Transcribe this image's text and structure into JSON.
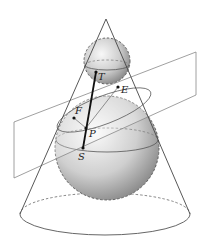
{
  "figure": {
    "labels": {
      "T": "T",
      "E": "E",
      "F": "F",
      "P": "P",
      "S": "S"
    }
  },
  "geometry": {
    "apex": [
      106,
      19
    ],
    "base_ellipse": {
      "cx": 105,
      "cy": 214,
      "rx": 85,
      "ry": 21
    },
    "small_sphere": {
      "cx": 107,
      "cy": 61,
      "r": 23
    },
    "large_sphere": {
      "cx": 107,
      "cy": 148,
      "r": 52
    },
    "points": {
      "T": [
        96,
        72
      ],
      "E": [
        118,
        87
      ],
      "F": [
        74,
        118
      ],
      "P": [
        86,
        128
      ],
      "S": [
        83,
        148
      ]
    }
  },
  "colors": {
    "line": "#555555",
    "thick_line": "#111111",
    "sphere_light": "#f4f4f4",
    "sphere_dark": "#8a8a8a"
  }
}
